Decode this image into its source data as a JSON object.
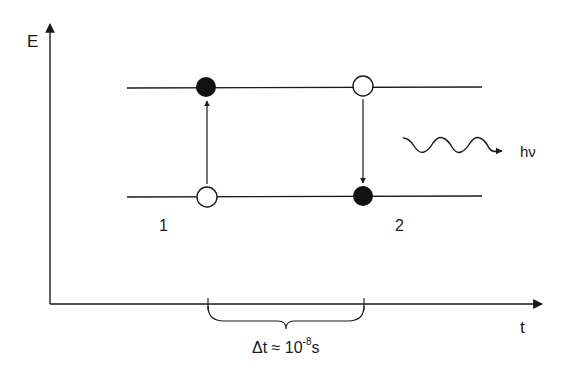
{
  "diagram": {
    "axes": {
      "y_label": "E",
      "x_label": "t"
    },
    "levels": [
      {
        "name": "upper",
        "y": 88
      },
      {
        "name": "lower",
        "y": 197
      }
    ],
    "states": [
      {
        "label": "1",
        "upper": "filled",
        "lower": "empty",
        "transition": "up"
      },
      {
        "label": "2",
        "upper": "empty",
        "lower": "filled",
        "transition": "down"
      }
    ],
    "photon": {
      "label": "hν",
      "icon": "wavy-arrow-icon"
    },
    "interval": {
      "label_prefix": "Δt ≈ 10",
      "exponent": "-8",
      "unit": "s"
    },
    "colors": {
      "line": "#1a1a1a",
      "background": "#ffffff"
    }
  }
}
